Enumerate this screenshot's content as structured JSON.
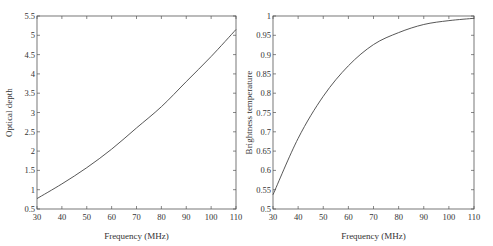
{
  "chart_data": [
    {
      "type": "line",
      "title": "",
      "xlabel": "Frequency (MHz)",
      "ylabel": "Optical depth",
      "xlim": [
        30,
        110
      ],
      "ylim": [
        0.5,
        5.5
      ],
      "xticks": [
        30,
        40,
        50,
        60,
        70,
        80,
        90,
        100,
        110
      ],
      "yticks": [
        0.5,
        1,
        1.5,
        2,
        2.5,
        3,
        3.5,
        4,
        4.5,
        5,
        5.5
      ],
      "xtick_labels": [
        "30",
        "40",
        "50",
        "60",
        "70",
        "80",
        "90",
        "100",
        "110"
      ],
      "ytick_labels": [
        "0.5",
        "1",
        "1.5",
        "2",
        "2.5",
        "3",
        "3.5",
        "4",
        "4.5",
        "5",
        "5.5"
      ],
      "grid": false,
      "legend": null,
      "series": [
        {
          "name": "Optical depth",
          "x": [
            30,
            40,
            50,
            60,
            70,
            80,
            90,
            100,
            110
          ],
          "values": [
            0.77,
            1.15,
            1.57,
            2.05,
            2.6,
            3.15,
            3.8,
            4.45,
            5.15
          ]
        }
      ]
    },
    {
      "type": "line",
      "title": "",
      "xlabel": "Frequency (MHz)",
      "ylabel": "Brightness temperature",
      "xlim": [
        30,
        110
      ],
      "ylim": [
        0.5,
        1.0
      ],
      "xticks": [
        30,
        40,
        50,
        60,
        70,
        80,
        90,
        100,
        110
      ],
      "yticks": [
        0.5,
        0.55,
        0.6,
        0.65,
        0.7,
        0.75,
        0.8,
        0.85,
        0.9,
        0.95,
        1
      ],
      "xtick_labels": [
        "30",
        "40",
        "50",
        "60",
        "70",
        "80",
        "90",
        "100",
        "110"
      ],
      "ytick_labels": [
        "0.5",
        "0.55",
        "0.6",
        "0.65",
        "0.7",
        "0.75",
        "0.8",
        "0.85",
        "0.9",
        "0.95",
        "1"
      ],
      "grid": false,
      "legend": null,
      "series": [
        {
          "name": "Brightness temperature",
          "x": [
            30,
            40,
            50,
            60,
            70,
            80,
            90,
            100,
            110
          ],
          "values": [
            0.537,
            0.683,
            0.792,
            0.871,
            0.926,
            0.957,
            0.978,
            0.988,
            0.994
          ]
        }
      ]
    }
  ],
  "style": {
    "axis_color": "#555555",
    "line_color": "#444444",
    "text_color": "#333333"
  }
}
